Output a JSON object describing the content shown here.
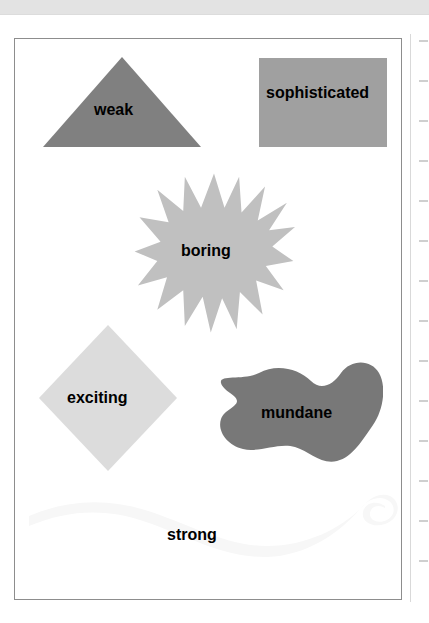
{
  "window": {
    "top_band": "toolbar-strip"
  },
  "right_rail": {
    "name": "vertical-ruler",
    "tick_count": 14
  },
  "canvas": {
    "name": "drawing-canvas",
    "background_color": "#ffffff",
    "border_color": "#8d8d8d"
  },
  "shapes": [
    {
      "id": "weak",
      "label": "weak",
      "kind": "triangle",
      "fill": "#808080",
      "icon": "triangle-shape"
    },
    {
      "id": "sophisticated",
      "label": "sophisticated",
      "kind": "rectangle",
      "fill": "#a0a0a0",
      "icon": "rectangle-shape"
    },
    {
      "id": "boring",
      "label": "boring",
      "kind": "star-burst",
      "fill": "#c0c0c0",
      "icon": "star-burst-shape"
    },
    {
      "id": "exciting",
      "label": "exciting",
      "kind": "diamond",
      "fill": "#dcdcdc",
      "icon": "diamond-shape"
    },
    {
      "id": "mundane",
      "label": "mundane",
      "kind": "blob",
      "fill": "#787878",
      "icon": "blob-shape"
    },
    {
      "id": "strong",
      "label": "strong",
      "kind": "wave-ribbon",
      "fill": "#f7f7f7",
      "icon": "wave-ribbon-shape"
    }
  ]
}
